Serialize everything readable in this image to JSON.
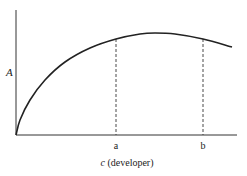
{
  "chart_data": {
    "type": "line",
    "title": "",
    "xlabel_var": "c",
    "xlabel_rest": " (developer)",
    "xlabel": "c (developer)",
    "ylabel": "A",
    "x_ticks": [
      "a",
      "b"
    ],
    "grid": false,
    "legend": null,
    "series": [
      {
        "name": "A(c)",
        "description": "Concave curve rising steeply from origin, peaking between a and b, then declining slightly",
        "points_px": [
          [
            16,
            135
          ],
          [
            20,
            120
          ],
          [
            30,
            100
          ],
          [
            45,
            80
          ],
          [
            65,
            62
          ],
          [
            90,
            48
          ],
          [
            116,
            39
          ],
          [
            140,
            34
          ],
          [
            155,
            33
          ],
          [
            175,
            34
          ],
          [
            203,
            39
          ],
          [
            232,
            47
          ]
        ]
      }
    ],
    "reference_lines": [
      {
        "label": "a",
        "x_px": 116,
        "y_top_px": 39,
        "style": "dashed"
      },
      {
        "label": "b",
        "x_px": 203,
        "y_top_px": 39,
        "style": "dashed"
      }
    ],
    "axes_px": {
      "origin": [
        16,
        135
      ],
      "x_end": 237,
      "y_top": 10
    },
    "colors": {
      "line": "#222222",
      "axis": "#333333"
    }
  }
}
